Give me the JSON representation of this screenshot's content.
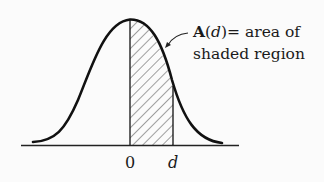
{
  "diagram": {
    "type": "normal-distribution-curve",
    "annotation": {
      "symbol": "A",
      "paren_open": "(",
      "variable": "d",
      "paren_close": ")",
      "line1_rest": "= area of",
      "line2": "shaded region"
    },
    "ticks": [
      {
        "label": "0"
      },
      {
        "label": "d"
      }
    ],
    "colors": {
      "curve": "#111111",
      "hatch": "#333333",
      "background": "#fbfbfb"
    }
  }
}
